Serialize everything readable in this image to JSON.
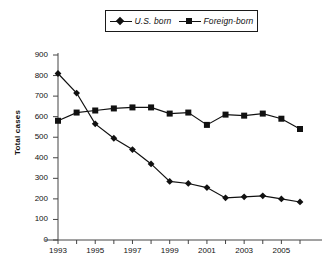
{
  "legend": {
    "position": "top-center",
    "entries": [
      {
        "label": "U.S. born",
        "marker": "diamond-marker-icon",
        "color": "#111111"
      },
      {
        "label": "Foreign-born",
        "marker": "square-marker-icon",
        "color": "#111111"
      }
    ]
  },
  "axes": {
    "ylabel": "Total cases",
    "yticks": [
      "900",
      "800",
      "700",
      "600",
      "500",
      "400",
      "300",
      "200",
      "100",
      "0"
    ],
    "xticks_labeled": [
      "1993",
      "1995",
      "1997",
      "1999",
      "2001",
      "2003",
      "2005"
    ]
  },
  "chart_data": {
    "type": "line",
    "title": "",
    "xlabel": "",
    "ylabel": "Total cases",
    "ylim": [
      0,
      900
    ],
    "xlim": [
      1993,
      2006
    ],
    "grid": false,
    "legend_position": "top-center",
    "x": [
      1993,
      1994,
      1995,
      1996,
      1997,
      1998,
      1999,
      2000,
      2001,
      2002,
      2003,
      2004,
      2005,
      2006
    ],
    "xtick_labels": [
      "1993",
      "",
      "1995",
      "",
      "1997",
      "",
      "1999",
      "",
      "2001",
      "",
      "2003",
      "",
      "2005",
      ""
    ],
    "ytick_values": [
      0,
      100,
      200,
      300,
      400,
      500,
      600,
      700,
      800,
      900
    ],
    "series": [
      {
        "name": "U.S. born",
        "marker": "diamond",
        "color": "#111111",
        "values": [
          810,
          715,
          565,
          495,
          440,
          370,
          285,
          275,
          255,
          205,
          210,
          215,
          200,
          185
        ]
      },
      {
        "name": "Foreign-born",
        "marker": "square",
        "color": "#111111",
        "values": [
          580,
          620,
          630,
          640,
          645,
          645,
          615,
          620,
          560,
          610,
          605,
          615,
          590,
          540
        ]
      }
    ]
  }
}
